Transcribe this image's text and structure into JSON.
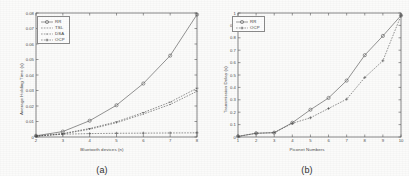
{
  "figure": {
    "background": "#fbfbfa",
    "axis_color": "#555555",
    "line_color": "#4a4a4a"
  },
  "panels": [
    {
      "caption": "(a)",
      "legend_position": "upper-left"
    },
    {
      "caption": "(b)",
      "legend_position": "upper-left"
    }
  ],
  "chart_data": [
    {
      "type": "line",
      "title": "",
      "xlabel": "Bluetooth devices (n)",
      "ylabel": "Average Holding Time (s)",
      "xlim": [
        2,
        8
      ],
      "ylim": [
        0,
        0.08
      ],
      "xticks": [
        2,
        3,
        4,
        5,
        6,
        7,
        8
      ],
      "xticklabels": [
        "2",
        "3",
        "4",
        "5",
        "6",
        "7",
        "8"
      ],
      "yticks": [
        0,
        0.01,
        0.02,
        0.03,
        0.04,
        0.05,
        0.06,
        0.07,
        0.08
      ],
      "yticklabels": [
        "0",
        "0.01",
        "0.02",
        "0.03",
        "0.04",
        "0.05",
        "0.06",
        "0.07",
        "0.08"
      ],
      "grid": false,
      "legend": [
        "RR",
        "TSL",
        "DSA",
        "OCP"
      ],
      "legend_markers": [
        "circle",
        "line",
        "dot",
        "plus"
      ],
      "x": [
        2,
        3,
        4,
        5,
        6,
        7,
        8
      ],
      "series": [
        {
          "name": "RR",
          "marker": "circle",
          "values": [
            0.0008,
            0.0035,
            0.0105,
            0.0205,
            0.0345,
            0.0525,
            0.079
          ]
        },
        {
          "name": "TSL",
          "marker": "line",
          "values": [
            0.0006,
            0.0022,
            0.0055,
            0.0098,
            0.0158,
            0.0225,
            0.0315
          ]
        },
        {
          "name": "DSA",
          "marker": "dot",
          "values": [
            0.0006,
            0.002,
            0.005,
            0.0092,
            0.0148,
            0.021,
            0.0295
          ]
        },
        {
          "name": "OCP",
          "marker": "plus",
          "values": [
            0.0005,
            0.0018,
            0.0022,
            0.0024,
            0.0025,
            0.0026,
            0.0027
          ]
        }
      ]
    },
    {
      "type": "line",
      "title": "",
      "xlabel": "Piconet Numbers",
      "ylabel": "Transmission Delay (s)",
      "xlim": [
        1,
        10
      ],
      "ylim": [
        0,
        1
      ],
      "xticks": [
        1,
        2,
        3,
        4,
        5,
        6,
        7,
        8,
        9,
        10
      ],
      "xticklabels": [
        "1",
        "2",
        "3",
        "4",
        "5",
        "6",
        "7",
        "8",
        "9",
        "10"
      ],
      "yticks": [
        0,
        0.1,
        0.2,
        0.3,
        0.4,
        0.5,
        0.6,
        0.7,
        0.8,
        0.9,
        1
      ],
      "yticklabels": [
        "0",
        "0.1",
        "0.2",
        "0.3",
        "0.4",
        "0.5",
        "0.6",
        "0.7",
        "0.8",
        "0.9",
        "1"
      ],
      "grid": false,
      "legend": [
        "RR",
        "OCP"
      ],
      "legend_markers": [
        "circle",
        "plus"
      ],
      "x": [
        1,
        2,
        3,
        4,
        5,
        6,
        7,
        8,
        9,
        10
      ],
      "series": [
        {
          "name": "RR",
          "marker": "circle",
          "values": [
            0.005,
            0.03,
            0.035,
            0.115,
            0.22,
            0.315,
            0.455,
            0.66,
            0.815,
            0.98
          ]
        },
        {
          "name": "OCP",
          "marker": "plus",
          "values": [
            0.005,
            0.03,
            0.035,
            0.11,
            0.155,
            0.23,
            0.305,
            0.48,
            0.615,
            0.98
          ]
        }
      ]
    }
  ]
}
